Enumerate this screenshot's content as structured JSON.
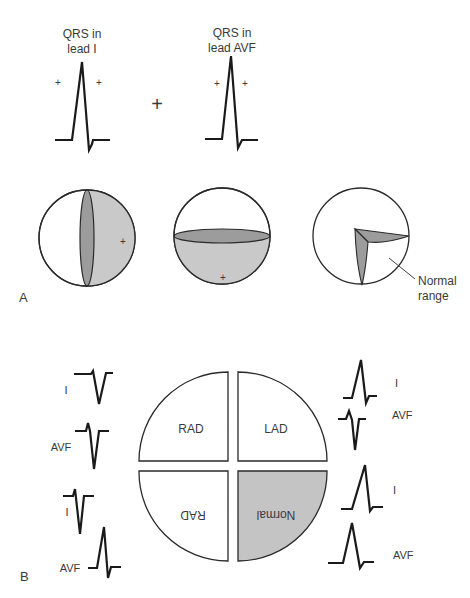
{
  "panel_a": {
    "label": "A",
    "qrs_lead_i": {
      "line1": "QRS in",
      "line2": "lead I"
    },
    "qrs_lead_avf": {
      "line1": "QRS in",
      "line2": "lead AVF"
    },
    "plus_symbol": "+",
    "normal_range_label": {
      "line1": "Normal",
      "line2": "range"
    }
  },
  "panel_b": {
    "label": "B",
    "quadrants": {
      "upper_left": "RAD",
      "upper_right": "LAD",
      "lower_left": "RAD",
      "lower_right": "Normal"
    },
    "left_leads": [
      {
        "lead": "I"
      },
      {
        "lead": "AVF"
      },
      {
        "lead": "I"
      },
      {
        "lead": "AVF"
      }
    ],
    "right_leads": [
      {
        "lead": "I"
      },
      {
        "lead": "AVF"
      },
      {
        "lead": "I"
      },
      {
        "lead": "AVF"
      }
    ]
  },
  "colors": {
    "light_shade": "#c8c8c8",
    "dark_shade": "#9a9a9a",
    "normal_fill": "#c4c4c4"
  }
}
